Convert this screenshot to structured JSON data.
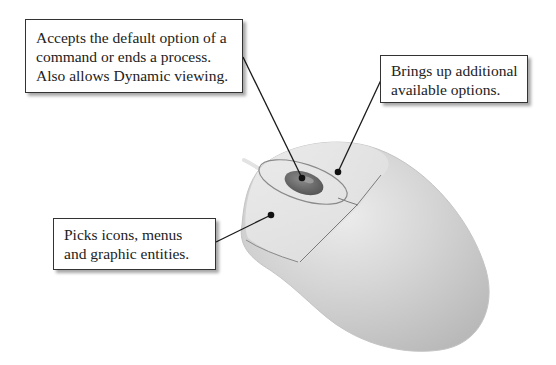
{
  "figure": {
    "callouts": [
      {
        "id": "middle-button",
        "target": "scroll wheel / middle button",
        "lines": [
          "Accepts the default option of a",
          "command or ends a process.",
          "Also allows Dynamic viewing."
        ]
      },
      {
        "id": "right-button",
        "target": "right mouse button",
        "lines": [
          "Brings up additional",
          "available options."
        ]
      },
      {
        "id": "left-button",
        "target": "left mouse button",
        "lines": [
          "Picks icons, menus",
          "and graphic entities."
        ]
      }
    ]
  },
  "colors": {
    "background": "#ffffff",
    "mouse_body": "#cfcfcf",
    "mouse_highlight": "#e6e6e6",
    "wheel": "#6a6a6a",
    "leader_line": "#1a1a1a",
    "box_border": "#333333"
  }
}
